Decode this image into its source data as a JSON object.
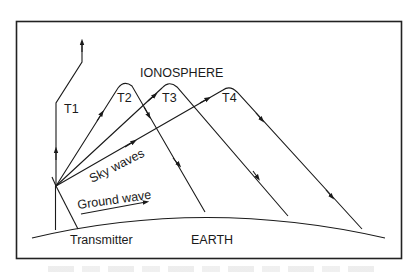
{
  "diagram": {
    "labels": {
      "ionosphere": "IONOSPHERE",
      "earth": "EARTH",
      "transmitter": "Transmitter",
      "sky_waves": "Sky waves",
      "ground_wave": "Ground wave",
      "t1": "T1",
      "t2": "T2",
      "t3": "T3",
      "t4": "T4"
    },
    "rays": [
      {
        "id": "T1",
        "behavior": "escapes through ionosphere"
      },
      {
        "id": "T2",
        "behavior": "refracted back to earth"
      },
      {
        "id": "T3",
        "behavior": "refracted back to earth"
      },
      {
        "id": "T4",
        "behavior": "refracted back to earth"
      }
    ],
    "colors": {
      "line": "#1a1a1a",
      "background": "#ffffff",
      "frame": "#222222"
    },
    "caption": ""
  }
}
